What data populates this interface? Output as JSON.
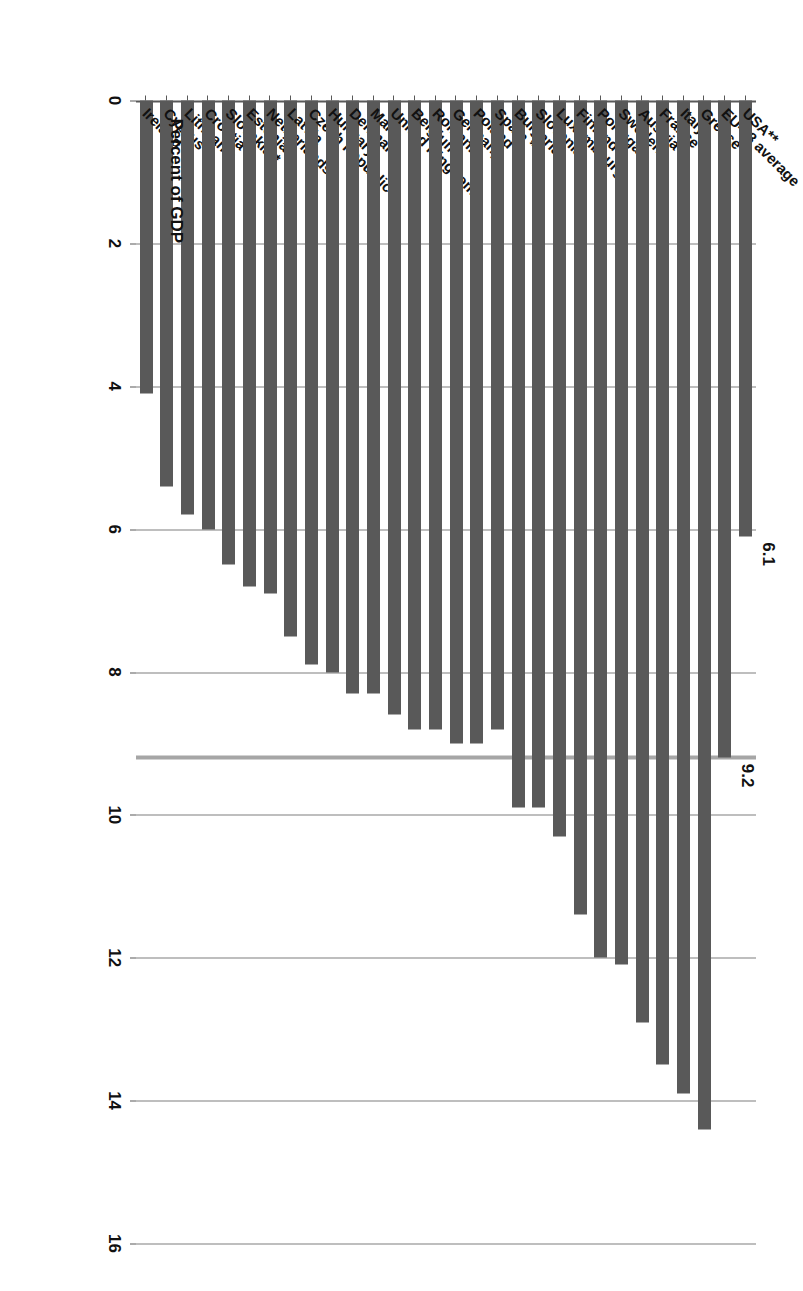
{
  "chart_data": {
    "type": "bar",
    "orientation": "horizontal",
    "title": "",
    "xlabel": "Percent of GDP",
    "ylabel": "",
    "xlim": [
      0,
      16
    ],
    "xticks": [
      "0",
      "2",
      "4",
      "6",
      "8",
      "10",
      "12",
      "14",
      "16"
    ],
    "grid": true,
    "legend": "none",
    "bar_color": "#595959",
    "reference_line": {
      "label": "9.2",
      "value": 9.2,
      "color": "#a6a6a6",
      "name": "EU-28 average reference line"
    },
    "annotations": [
      {
        "label": "9.2",
        "value": 9.2,
        "category": "EU-28 average"
      },
      {
        "label": "6.1",
        "value": 6.1,
        "category": "USA**"
      }
    ],
    "categories": [
      "Ireland",
      "Cyprus",
      "Lithuania",
      "Croatia *",
      "Slovakia *",
      "Estonia",
      "Netherlands",
      "Latvia",
      "Czech Republic",
      "Hungary",
      "Denmark",
      "Malta",
      "United Kingdom",
      "Belgium",
      "Romania",
      "Germany",
      "Poland",
      "Spain *",
      "Bulgaria",
      "Slovenia",
      "Luxembourg",
      "Finland",
      "Portugal",
      "Sweden",
      "Austria",
      "France",
      "Italy",
      "Greece",
      "EU-28 average",
      "USA**"
    ],
    "values": [
      4.1,
      5.4,
      5.8,
      6.0,
      6.5,
      6.8,
      6.9,
      7.5,
      7.9,
      8.0,
      8.3,
      8.3,
      8.6,
      8.8,
      8.8,
      9.0,
      9.0,
      8.8,
      9.9,
      9.9,
      10.3,
      11.4,
      12.0,
      12.1,
      12.9,
      13.5,
      13.9,
      14.4,
      9.2,
      6.1
    ]
  }
}
